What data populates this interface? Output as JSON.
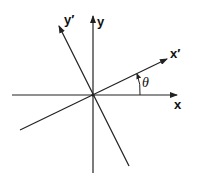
{
  "diagram": {
    "labels": {
      "x": "x",
      "y": "y",
      "x_prime": "x′",
      "y_prime": "y′",
      "angle": "θ"
    },
    "colors": {
      "stroke": "#222222",
      "background": "#ffffff"
    }
  }
}
